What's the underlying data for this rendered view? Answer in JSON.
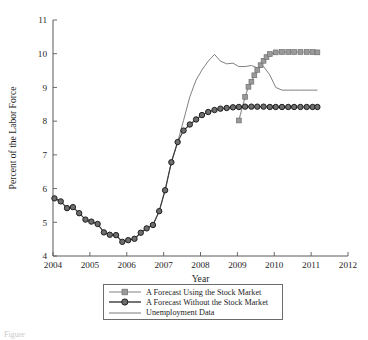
{
  "chart_data": {
    "type": "line",
    "title": "",
    "xlabel": "Year",
    "ylabel": "Percent of the Labor Force",
    "xlim": [
      2004,
      2012
    ],
    "ylim": [
      4,
      11
    ],
    "xticks": [
      "2004",
      "2005",
      "2006",
      "2007",
      "2008",
      "2009",
      "2010",
      "2011",
      "2012"
    ],
    "yticks": [
      "4",
      "5",
      "6",
      "7",
      "8",
      "9",
      "10",
      "11"
    ],
    "grid": false,
    "legend_position": "below-axes-center",
    "series": [
      {
        "name": "A Forecast Using the Stock Market",
        "marker": "square",
        "color": "#8e8e8e",
        "x": [
          2009.04,
          2009.21,
          2009.3,
          2009.38,
          2009.46,
          2009.54,
          2009.63,
          2009.71,
          2009.79,
          2009.88,
          2010.04,
          2010.21,
          2010.38,
          2010.54,
          2010.71,
          2010.88,
          2011.04,
          2011.17
        ],
        "y": [
          8.02,
          8.72,
          9.02,
          9.17,
          9.36,
          9.52,
          9.66,
          9.79,
          9.9,
          9.99,
          10.04,
          10.05,
          10.05,
          10.05,
          10.05,
          10.05,
          10.05,
          10.04
        ]
      },
      {
        "name": "A Forecast Without the Stock Market",
        "marker": "circle",
        "color": "#3a3a3a",
        "x": [
          2004.04,
          2004.21,
          2004.38,
          2004.54,
          2004.71,
          2004.88,
          2005.04,
          2005.21,
          2005.38,
          2005.54,
          2005.71,
          2005.88,
          2006.04,
          2006.21,
          2006.38,
          2006.54,
          2006.71,
          2006.88,
          2007.04,
          2007.21,
          2007.38,
          2007.54,
          2007.71,
          2007.88,
          2008.04,
          2008.21,
          2008.38,
          2008.54,
          2008.71,
          2008.88,
          2009.04,
          2009.21,
          2009.38,
          2009.54,
          2009.71,
          2009.88,
          2010.04,
          2010.21,
          2010.38,
          2010.54,
          2010.71,
          2010.88,
          2011.04,
          2011.17
        ],
        "y": [
          5.71,
          5.62,
          5.42,
          5.45,
          5.27,
          5.08,
          5.02,
          4.95,
          4.7,
          4.63,
          4.62,
          4.42,
          4.47,
          4.51,
          4.69,
          4.82,
          4.92,
          5.33,
          5.95,
          6.78,
          7.38,
          7.72,
          7.9,
          8.05,
          8.18,
          8.27,
          8.33,
          8.37,
          8.39,
          8.41,
          8.42,
          8.43,
          8.43,
          8.43,
          8.43,
          8.42,
          8.42,
          8.42,
          8.42,
          8.42,
          8.42,
          8.42,
          8.42,
          8.42
        ]
      },
      {
        "name": "Unemployment Data",
        "marker": "none",
        "color": "#7a7a7a",
        "x": [
          2004.04,
          2004.21,
          2004.38,
          2004.54,
          2004.71,
          2004.88,
          2005.04,
          2005.21,
          2005.38,
          2005.54,
          2005.71,
          2005.88,
          2006.04,
          2006.21,
          2006.38,
          2006.54,
          2006.71,
          2006.88,
          2007.04,
          2007.21,
          2007.38,
          2007.54,
          2007.71,
          2007.88,
          2008.04,
          2008.21,
          2008.38,
          2008.54,
          2008.71,
          2008.88,
          2009.04,
          2009.21,
          2009.38,
          2009.54,
          2009.71,
          2009.88,
          2010.04,
          2010.21,
          2010.38,
          2010.54,
          2010.71,
          2010.88,
          2011.04,
          2011.17
        ],
        "y": [
          5.71,
          5.62,
          5.42,
          5.45,
          5.27,
          5.08,
          5.02,
          4.95,
          4.7,
          4.63,
          4.62,
          4.42,
          4.47,
          4.51,
          4.69,
          4.82,
          4.92,
          5.33,
          5.95,
          6.78,
          7.38,
          8.02,
          8.72,
          9.22,
          9.52,
          9.78,
          9.98,
          9.78,
          9.7,
          9.72,
          9.62,
          9.62,
          9.65,
          9.58,
          9.62,
          9.37,
          9.0,
          8.92,
          8.92,
          8.92,
          8.92,
          8.92,
          8.92,
          8.92
        ]
      }
    ]
  },
  "legend": {
    "items": [
      {
        "label": "A Forecast Using the Stock Market",
        "marker": "square",
        "color": "#8e8e8e"
      },
      {
        "label": "A Forecast Without the Stock Market",
        "marker": "circle",
        "color": "#3a3a3a"
      },
      {
        "label": "Unemployment Data",
        "marker": "none",
        "color": "#7a7a7a"
      }
    ]
  },
  "caption": {
    "text": "Figure"
  }
}
